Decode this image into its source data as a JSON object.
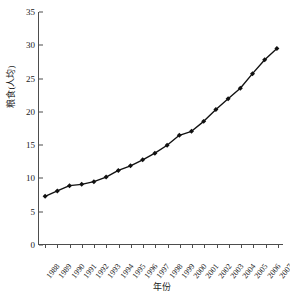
{
  "chart_data": {
    "type": "line",
    "title": "",
    "xlabel": "年份",
    "ylabel": "粮食(人均)",
    "categories": [
      "1988",
      "1989",
      "1990",
      "1991",
      "1992",
      "1993",
      "1994",
      "1995",
      "1996",
      "1997",
      "1998",
      "1999",
      "2000",
      "2001",
      "2002",
      "2003",
      "2004",
      "2005",
      "2006",
      "2007"
    ],
    "values": [
      7.2,
      8.0,
      8.8,
      9.0,
      9.4,
      10.1,
      11.1,
      11.8,
      12.7,
      13.7,
      14.9,
      16.4,
      17.0,
      18.5,
      20.3,
      21.9,
      23.5,
      25.7,
      27.8,
      29.5
    ],
    "series": [
      {
        "name": "粮食(人均)",
        "values": [
          7.2,
          8.0,
          8.8,
          9.0,
          9.4,
          10.1,
          11.1,
          11.8,
          12.7,
          13.7,
          14.9,
          16.4,
          17.0,
          18.5,
          20.3,
          21.9,
          23.5,
          25.7,
          27.8,
          29.5
        ]
      }
    ],
    "ylim": [
      0,
      35
    ],
    "y_ticks": [
      0,
      5,
      10,
      15,
      20,
      25,
      30,
      35
    ],
    "grid": false,
    "legend": "none",
    "line_color": "#111111",
    "marker": "diamond",
    "marker_color": "#111111"
  }
}
